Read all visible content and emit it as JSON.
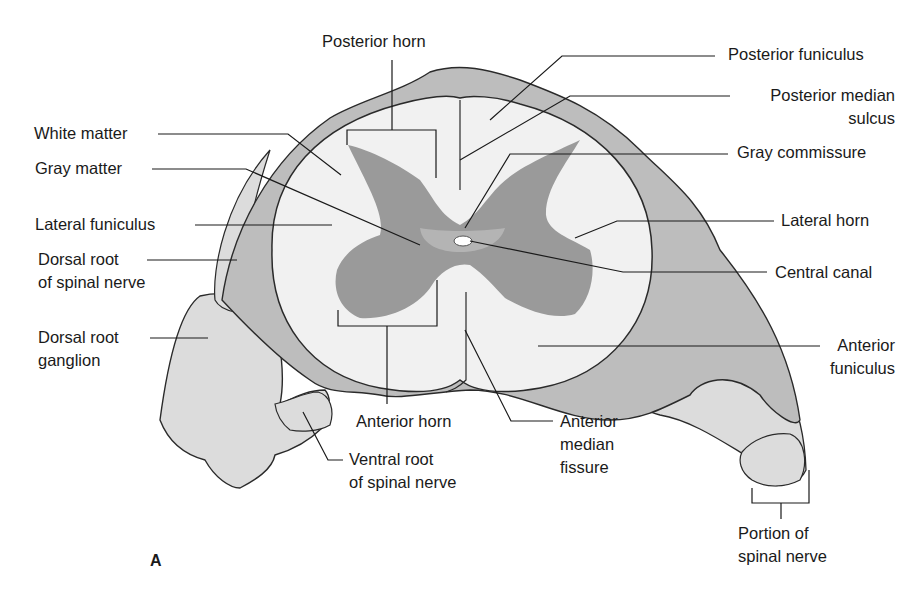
{
  "figure": {
    "panel_label": "A",
    "colors": {
      "background": "#ffffff",
      "white_matter": "#f1f1f1",
      "gray_matter": "#9a9a9a",
      "meninges": "#bdbdbd",
      "nerve_tissue": "#dcdcdc",
      "outline": "#2a2a2a",
      "leader_line": "#1a1a1a"
    }
  },
  "labels": {
    "posterior_horn": "Posterior horn",
    "white_matter": "White matter",
    "gray_matter": "Gray matter",
    "lateral_funiculus": "Lateral funiculus",
    "dorsal_root_line1": "Dorsal root",
    "dorsal_root_line2": "of spinal nerve",
    "dorsal_root_ganglion_line1": "Dorsal root",
    "dorsal_root_ganglion_line2": "ganglion",
    "posterior_funiculus": "Posterior funiculus",
    "posterior_median_sulcus_line1": "Posterior median",
    "posterior_median_sulcus_line2": "sulcus",
    "gray_commissure": "Gray commissure",
    "lateral_horn": "Lateral horn",
    "central_canal": "Central canal",
    "anterior_funiculus_line1": "Anterior",
    "anterior_funiculus_line2": "funiculus",
    "anterior_horn": "Anterior horn",
    "anterior_median_fissure_line1": "Anterior",
    "anterior_median_fissure_line2": "median",
    "anterior_median_fissure_line3": "fissure",
    "ventral_root_line1": "Ventral root",
    "ventral_root_line2": "of spinal nerve",
    "portion_spinal_nerve_line1": "Portion of",
    "portion_spinal_nerve_line2": "spinal nerve"
  }
}
